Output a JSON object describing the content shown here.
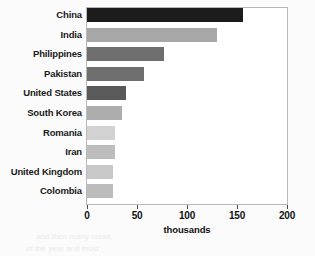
{
  "chart_data": {
    "type": "bar",
    "orientation": "horizontal",
    "title": "",
    "xlabel": "thousands",
    "ylabel": "",
    "xlim": [
      0,
      200
    ],
    "xticks": [
      0,
      50,
      100,
      150,
      200
    ],
    "grid": false,
    "legend": null,
    "categories": [
      "China",
      "India",
      "Philippines",
      "Pakistan",
      "United States",
      "South Korea",
      "Romania",
      "Iran",
      "United Kingdom",
      "Colombia"
    ],
    "values": [
      156,
      130,
      77,
      57,
      39,
      35,
      28,
      28,
      26,
      26
    ],
    "bar_colors": [
      "#1c1c1c",
      "#a8a8a8",
      "#6e6e6e",
      "#6e6e6e",
      "#5a5a5a",
      "#adadad",
      "#d2d2d2",
      "#bdbdbd",
      "#c8c8c8",
      "#bcbcbc"
    ]
  },
  "axis": {
    "tick_labels": [
      "0",
      "50",
      "100",
      "150",
      "200"
    ],
    "title": "thousands"
  },
  "background_text": {
    "line1": "IN THE WORLD",
    "line2": "in the world",
    "line3": "sey notes that every such day th",
    "line4": "nation size the most note",
    "line5": "other than a next from t",
    "line6": "ation for a Similar Lists",
    "line7": "and then many count",
    "line8": "of the year and most"
  }
}
